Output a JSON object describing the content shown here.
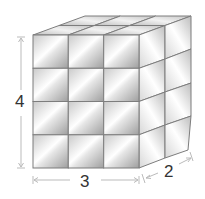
{
  "diagram": {
    "type": "rectangular-prism-of-unit-cubes",
    "dimensions": {
      "height": {
        "label": "4",
        "value": 4
      },
      "width": {
        "label": "3",
        "value": 3
      },
      "depth": {
        "label": "2",
        "value": 2
      }
    },
    "front_grid": {
      "rows": 4,
      "cols": 3
    },
    "right_grid": {
      "rows": 4,
      "cols": 2
    },
    "top_grid": {
      "rows": 2,
      "cols": 3
    },
    "colors": {
      "cube_light": "#f4f4f4",
      "cube_mid": "#d2d2d2",
      "cube_dark": "#9a9a9a",
      "edge": "#7d7d7d",
      "dimension_line": "#bbbbbb",
      "label": "#333333"
    }
  }
}
